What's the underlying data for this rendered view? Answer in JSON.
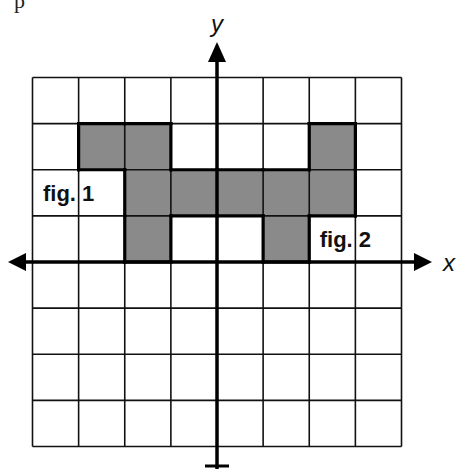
{
  "top_fragment": "p",
  "axes": {
    "x_label": "x",
    "y_label": "y",
    "x_range": [
      -4,
      4
    ],
    "y_range": [
      -4,
      4
    ],
    "cell_px": 46.125,
    "origin_px": [
      217,
      262
    ]
  },
  "colors": {
    "background": "#ffffff",
    "grid_line": "#111111",
    "axis": "#000000",
    "shade": "#8a8a8a",
    "outline": "#000000"
  },
  "figures": [
    {
      "label": "fig. 1",
      "label_cell": {
        "x": -4,
        "y": 1,
        "w": 2
      },
      "cells": [
        {
          "x": -3,
          "y": 2
        },
        {
          "x": -2,
          "y": 2
        },
        {
          "x": -2,
          "y": 1
        },
        {
          "x": -1,
          "y": 1
        },
        {
          "x": 0,
          "y": 1
        },
        {
          "x": -2,
          "y": 0
        }
      ]
    },
    {
      "label": "fig. 2",
      "label_cell": {
        "x": 2,
        "y": 0,
        "w": 2
      },
      "cells": [
        {
          "x": 2,
          "y": 2
        },
        {
          "x": 1,
          "y": 1
        },
        {
          "x": 2,
          "y": 1
        },
        {
          "x": 1,
          "y": 0
        }
      ]
    }
  ]
}
